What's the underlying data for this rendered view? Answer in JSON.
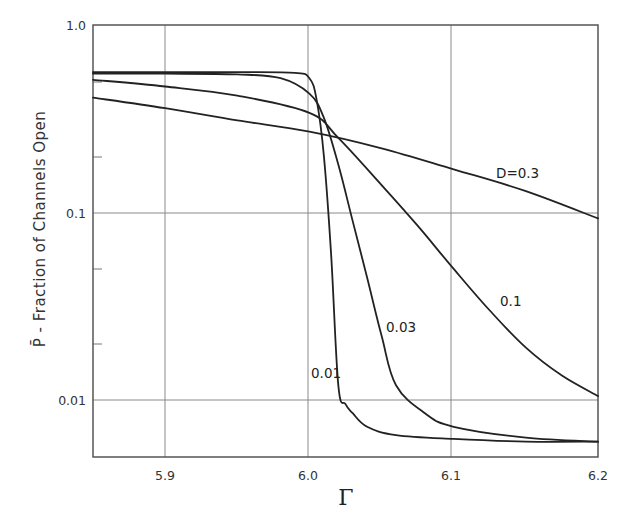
{
  "chart_data": {
    "type": "line",
    "title": "",
    "xlabel": "Γ",
    "ylabel": "P̄ - Fraction of Channels Open",
    "xscale": "linear",
    "yscale": "log",
    "xlim": [
      5.85,
      6.2
    ],
    "ylim": [
      0.005,
      1.0
    ],
    "grid": true,
    "legend": "inline curve labels",
    "x_ticks": [
      5.9,
      6.0,
      6.1,
      6.2
    ],
    "x_tick_labels": [
      "5.9",
      "6.0",
      "6.1",
      "6.2"
    ],
    "y_ticks": [
      1.0,
      0.1,
      0.01
    ],
    "y_tick_labels": [
      "1.0",
      "0.1",
      "0.01"
    ],
    "y_minor_ticks": [
      0.5,
      0.2,
      0.05,
      0.02
    ],
    "series": [
      {
        "name": "D=0.01",
        "label": "0.01",
        "x": [
          5.85,
          5.9,
          5.95,
          5.99,
          6.0,
          6.005,
          6.01,
          6.015,
          6.02,
          6.025,
          6.03,
          6.04,
          6.06,
          6.1,
          6.15,
          6.2
        ],
        "y": [
          0.56,
          0.56,
          0.56,
          0.555,
          0.52,
          0.4,
          0.2,
          0.06,
          0.012,
          0.0095,
          0.0085,
          0.0072,
          0.0065,
          0.0062,
          0.006,
          0.006
        ]
      },
      {
        "name": "D=0.03",
        "label": "0.03",
        "x": [
          5.85,
          5.9,
          5.95,
          5.98,
          6.0,
          6.01,
          6.02,
          6.03,
          6.04,
          6.05,
          6.06,
          6.08,
          6.1,
          6.15,
          6.2
        ],
        "y": [
          0.55,
          0.55,
          0.545,
          0.52,
          0.43,
          0.32,
          0.18,
          0.09,
          0.045,
          0.022,
          0.012,
          0.0085,
          0.0072,
          0.0063,
          0.006
        ]
      },
      {
        "name": "D=0.1",
        "label": "0.1",
        "x": [
          5.85,
          5.9,
          5.95,
          6.0,
          6.02,
          6.05,
          6.075,
          6.1,
          6.125,
          6.15,
          6.175,
          6.2
        ],
        "y": [
          0.51,
          0.47,
          0.42,
          0.34,
          0.25,
          0.14,
          0.085,
          0.05,
          0.03,
          0.019,
          0.0135,
          0.0105
        ]
      },
      {
        "name": "D=0.3",
        "label": "D=0.3",
        "x": [
          5.85,
          5.9,
          5.95,
          6.0,
          6.05,
          6.1,
          6.15,
          6.2
        ],
        "y": [
          0.41,
          0.36,
          0.31,
          0.27,
          0.22,
          0.17,
          0.13,
          0.093
        ]
      }
    ]
  },
  "labels": {
    "ylabel": "P̄ - Fraction of Channels Open",
    "xlabel": "Γ",
    "curve_d03": "D=0.3",
    "curve_d01": "0.1",
    "curve_d003": "0.03",
    "curve_d001": "0.01",
    "x_tick_59": "5.9",
    "x_tick_60": "6.0",
    "x_tick_61": "6.1",
    "x_tick_62": "6.2",
    "y_tick_1": "1.0",
    "y_tick_01": "0.1",
    "y_tick_001": "0.01"
  },
  "colors": {
    "ink": "#222222",
    "grid": "#777777",
    "background": "#ffffff"
  }
}
